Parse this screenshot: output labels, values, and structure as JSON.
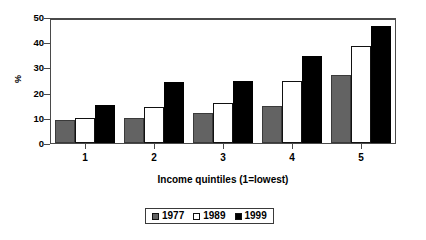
{
  "chart_data": {
    "type": "bar",
    "title": "",
    "xlabel": "Income quintiles (1=lowest)",
    "ylabel": "%",
    "categories": [
      "1",
      "2",
      "3",
      "4",
      "5"
    ],
    "series": [
      {
        "name": "1977",
        "color": "#636363",
        "values": [
          9,
          10,
          12,
          14.5,
          27
        ]
      },
      {
        "name": "1989",
        "color": "#ffffff",
        "values": [
          10,
          14.2,
          16,
          24.5,
          38.5
        ]
      },
      {
        "name": "1999",
        "color": "#000000",
        "values": [
          15,
          24.2,
          24.5,
          34.5,
          46.5
        ]
      }
    ],
    "ylim": [
      0,
      50
    ],
    "yticks": [
      "0",
      "10",
      "20",
      "30",
      "40",
      "50"
    ],
    "grid": false,
    "legend_position": "bottom-center"
  }
}
